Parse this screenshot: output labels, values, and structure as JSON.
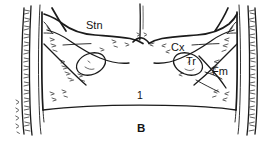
{
  "figure": {
    "panel_letter": "B",
    "background_color": "#ffffff",
    "ink_color": "#1b1b1b",
    "type": "line-drawing",
    "labels": [
      {
        "id": "stn",
        "text": "Stn",
        "x": 86,
        "y": 29
      },
      {
        "id": "cx",
        "text": "Cx",
        "x": 171,
        "y": 51
      },
      {
        "id": "tr",
        "text": "Tr",
        "x": 186,
        "y": 65
      },
      {
        "id": "fm",
        "text": "Fm",
        "x": 212,
        "y": 75
      },
      {
        "id": "one",
        "text": "1",
        "x": 137,
        "y": 99
      },
      {
        "id": "panel",
        "text": "B",
        "x": 139,
        "y": 131
      }
    ]
  }
}
